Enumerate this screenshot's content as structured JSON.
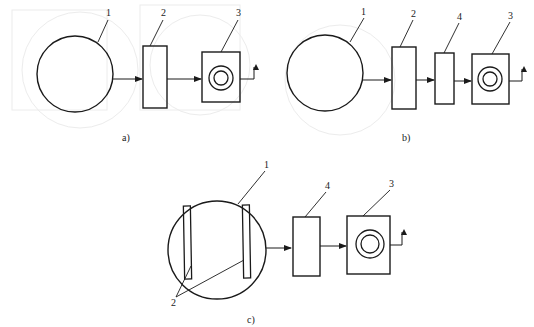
{
  "figure": {
    "panels": [
      {
        "id": "a",
        "caption": "a)",
        "labels": {
          "circle": "1",
          "block2": "2",
          "block3": "3"
        },
        "components": [
          "1",
          "2",
          "3"
        ]
      },
      {
        "id": "b",
        "caption": "b)",
        "labels": {
          "circle": "1",
          "block2": "2",
          "block4": "4",
          "block3": "3"
        },
        "components": [
          "1",
          "2",
          "4",
          "3"
        ]
      },
      {
        "id": "c",
        "caption": "c)",
        "labels": {
          "circle": "1",
          "plates": "2",
          "block4": "4",
          "block3": "3"
        },
        "components": [
          "1 (with 2 inside)",
          "4",
          "3"
        ]
      }
    ],
    "colors": {
      "line": "#1a1a1a",
      "background": "#ffffff",
      "ghost": "#e6e6e6"
    }
  }
}
